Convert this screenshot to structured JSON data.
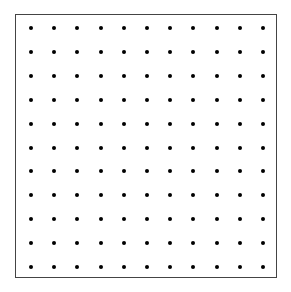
{
  "grid": {
    "rows": 11,
    "cols": 11,
    "first_dot_x": 31,
    "first_dot_y": 28,
    "last_dot_x": 263,
    "last_dot_y": 267,
    "dot_color": "#000000",
    "border_color": "#444444",
    "background": "#ffffff"
  }
}
